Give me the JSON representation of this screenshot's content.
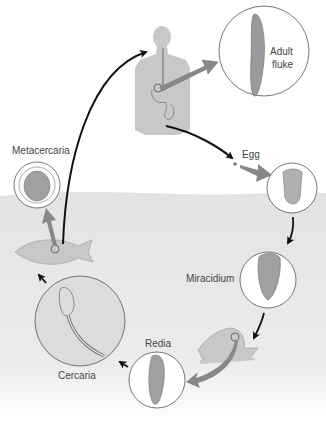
{
  "stages": {
    "adult": {
      "label_line1": "Adult",
      "label_line2": "fluke"
    },
    "egg": {
      "label": "Egg"
    },
    "miracidium": {
      "label": "Miracidium"
    },
    "redia": {
      "label": "Redia"
    },
    "cercaria": {
      "label": "Cercaria"
    },
    "metacercaria": {
      "label": "Metacercaria"
    }
  },
  "hosts": [
    "human",
    "snail",
    "fish"
  ],
  "colors": {
    "water": "#e6e6e6",
    "host_fill": "#c8c8c8",
    "circle_stroke": "#444444",
    "arrow_black": "#111111",
    "arrow_gray": "#888888",
    "organism_fill": "#9a9a9a"
  }
}
